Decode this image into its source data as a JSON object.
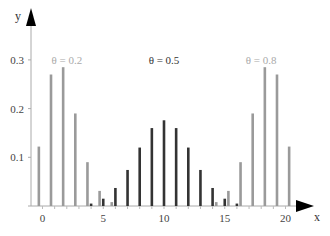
{
  "chart_data": {
    "type": "bar",
    "title": "",
    "xlabel": "x",
    "ylabel": "y",
    "xlim": [
      -1.5,
      23.5
    ],
    "ylim": [
      0,
      0.38
    ],
    "xticks": [
      0,
      5,
      10,
      15,
      20
    ],
    "xtick_labels": [
      "0",
      "5",
      "10",
      "15",
      "20"
    ],
    "yticks": [
      0.1,
      0.2,
      0.3
    ],
    "ytick_labels": [
      "0.1",
      "0.2",
      "0.3"
    ],
    "grid": false,
    "legend_position": "inline-annotations",
    "series": [
      {
        "name": "θ = 0.2",
        "label": "θ = 0.2",
        "color": "#9a9a9a",
        "offset": -0.3,
        "x": [
          0,
          1,
          2,
          3,
          4,
          5,
          6
        ],
        "values": [
          0.122,
          0.27,
          0.285,
          0.19,
          0.09,
          0.031,
          0.008
        ],
        "label_pos": {
          "x": 2.0,
          "y": 0.3
        }
      },
      {
        "name": "θ = 0.5",
        "label": "θ = 0.5",
        "color": "#333333",
        "offset": 0,
        "x": [
          4,
          5,
          6,
          7,
          8,
          9,
          10,
          11,
          12,
          13,
          14,
          15,
          16
        ],
        "values": [
          0.005,
          0.015,
          0.037,
          0.074,
          0.12,
          0.16,
          0.176,
          0.16,
          0.12,
          0.074,
          0.037,
          0.015,
          0.005
        ],
        "label_pos": {
          "x": 10.0,
          "y": 0.3
        }
      },
      {
        "name": "θ = 0.8",
        "label": "θ = 0.8",
        "color": "#9a9a9a",
        "offset": 0.3,
        "x": [
          14,
          15,
          16,
          17,
          18,
          19,
          20
        ],
        "values": [
          0.008,
          0.031,
          0.09,
          0.19,
          0.285,
          0.27,
          0.122
        ],
        "label_pos": {
          "x": 18.0,
          "y": 0.3
        }
      }
    ]
  },
  "labels": {
    "x_axis": "x",
    "y_axis": "y",
    "theta_02": "θ = 0.2",
    "theta_05": "θ = 0.5",
    "theta_08": "θ = 0.8"
  }
}
